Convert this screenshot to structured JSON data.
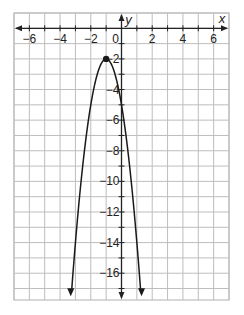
{
  "chart_data": {
    "type": "line",
    "title": "",
    "xlabel": "x",
    "ylabel": "y",
    "xlim": [
      -7,
      7
    ],
    "ylim": [
      -17.75,
      1
    ],
    "grid": true,
    "grid_step": 1,
    "x_ticks": [
      -6,
      -4,
      -2,
      0,
      2,
      4,
      6
    ],
    "x_tick_labels": [
      "−6",
      "−4",
      "−2",
      "0",
      "2",
      "4",
      "6"
    ],
    "y_ticks": [
      -2,
      -4,
      -6,
      -8,
      -10,
      -12,
      -14,
      -16
    ],
    "y_tick_labels": [
      "−2",
      "−4",
      "−6",
      "−8",
      "−10",
      "−12",
      "−14",
      "−16"
    ],
    "series": [
      {
        "name": "parabola",
        "equation": "y = -3(x + 1)^2 - 2",
        "a": -3,
        "h": -1,
        "k": -2,
        "x_range": [
          -3.4,
          1.4
        ],
        "arrows_at_ends": true,
        "points": [
          {
            "x": -3,
            "y": -14
          },
          {
            "x": -2,
            "y": -5
          },
          {
            "x": -1,
            "y": -2
          },
          {
            "x": 0,
            "y": -5
          },
          {
            "x": 1,
            "y": -14
          }
        ]
      }
    ],
    "annotations": [
      {
        "type": "point",
        "label": "vertex",
        "x": -1,
        "y": -2
      }
    ]
  },
  "colors": {
    "grid": "#bdbdbd",
    "axis": "#222222",
    "curve": "#1a1a1a",
    "background": "#ffffff"
  }
}
